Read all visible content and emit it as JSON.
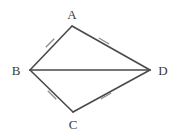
{
  "figure": {
    "type": "geometry-diagram",
    "shape_name": "kite ABCD",
    "background_color": "#ffffff",
    "stroke_color": "#4a4a4a",
    "tick_color": "#8a8a8a",
    "label_color": "#3a3a3a",
    "vertices": [
      {
        "name": "A",
        "label": "A",
        "x": 72,
        "y": 26,
        "label_x": 72,
        "label_y": 14
      },
      {
        "name": "B",
        "label": "B",
        "x": 30,
        "y": 70,
        "label_x": 16,
        "label_y": 70
      },
      {
        "name": "C",
        "label": "C",
        "x": 73,
        "y": 112,
        "label_x": 73,
        "label_y": 124
      },
      {
        "name": "D",
        "label": "D",
        "x": 150,
        "y": 70,
        "label_x": 163,
        "label_y": 70
      }
    ],
    "edges": [
      {
        "name": "BA",
        "from": "B",
        "to": "A",
        "ticks": 1
      },
      {
        "name": "AD",
        "from": "A",
        "to": "D",
        "ticks": 1
      },
      {
        "name": "BC",
        "from": "B",
        "to": "C",
        "ticks": 1
      },
      {
        "name": "CD",
        "from": "C",
        "to": "D",
        "ticks": 1
      },
      {
        "name": "BD",
        "from": "B",
        "to": "D",
        "ticks": 0,
        "is_diagonal": true
      }
    ],
    "tick_marks": [
      {
        "name": "tick-ba",
        "edge": "BA",
        "x": 50,
        "y": 43,
        "angle": 45
      },
      {
        "name": "tick-ad",
        "edge": "AD",
        "x": 104,
        "y": 41,
        "angle": -60
      },
      {
        "name": "tick-bc",
        "edge": "BC",
        "x": 52,
        "y": 95,
        "angle": -45
      },
      {
        "name": "tick-cd",
        "edge": "CD",
        "x": 106,
        "y": 96,
        "angle": 60
      }
    ]
  }
}
